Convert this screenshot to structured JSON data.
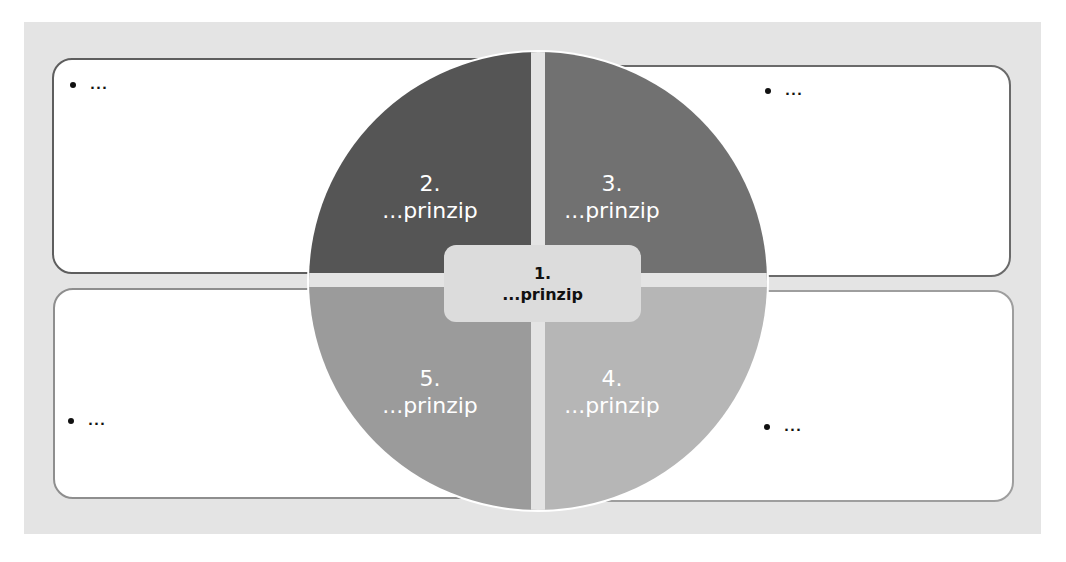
{
  "diagram": {
    "type": "five-principles-circle",
    "center": {
      "number": "1.",
      "label": "...prinzip"
    },
    "quadrants": [
      {
        "position": "top-left",
        "number": "2.",
        "label": "...prinzip",
        "color": "#555555"
      },
      {
        "position": "top-right",
        "number": "3.",
        "label": "...prinzip",
        "color": "#717171"
      },
      {
        "position": "bottom-right",
        "number": "4.",
        "label": "...prinzip",
        "color": "#b6b6b6"
      },
      {
        "position": "bottom-left",
        "number": "5.",
        "label": "...prinzip",
        "color": "#9b9b9b"
      }
    ],
    "boxes": [
      {
        "position": "top-left",
        "bullet": "..."
      },
      {
        "position": "top-right",
        "bullet": "..."
      },
      {
        "position": "bottom-left",
        "bullet": "..."
      },
      {
        "position": "bottom-right",
        "bullet": "..."
      }
    ],
    "colors": {
      "background": "#e4e4e4",
      "box": "#ffffff",
      "center": "#dcdcdc",
      "gap": "#e4e4e4"
    }
  }
}
